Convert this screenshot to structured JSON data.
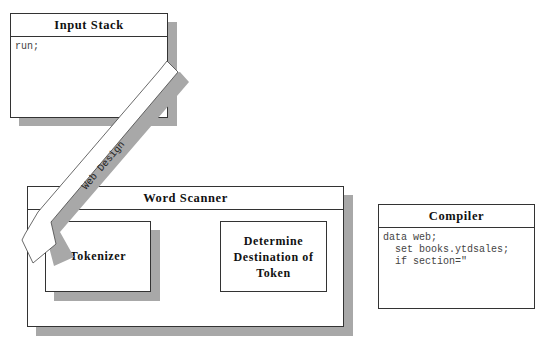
{
  "diagram": {
    "input_stack": {
      "title": "Input Stack",
      "content": "run;"
    },
    "word_scanner": {
      "title": "Word Scanner",
      "tokenizer": {
        "label": "Tokenizer"
      },
      "determine": {
        "label": "Determine\nDestination of\nToken"
      }
    },
    "compiler": {
      "title": "Compiler",
      "content": "data web;\n  set books.ytdsales;\n  if section=\""
    },
    "arrow": {
      "label": "Web Design",
      "direction": "from Input Stack to Tokenizer"
    },
    "colors": {
      "border": "#333333",
      "shadow": "#a8a8a8",
      "background": "#ffffff"
    }
  }
}
